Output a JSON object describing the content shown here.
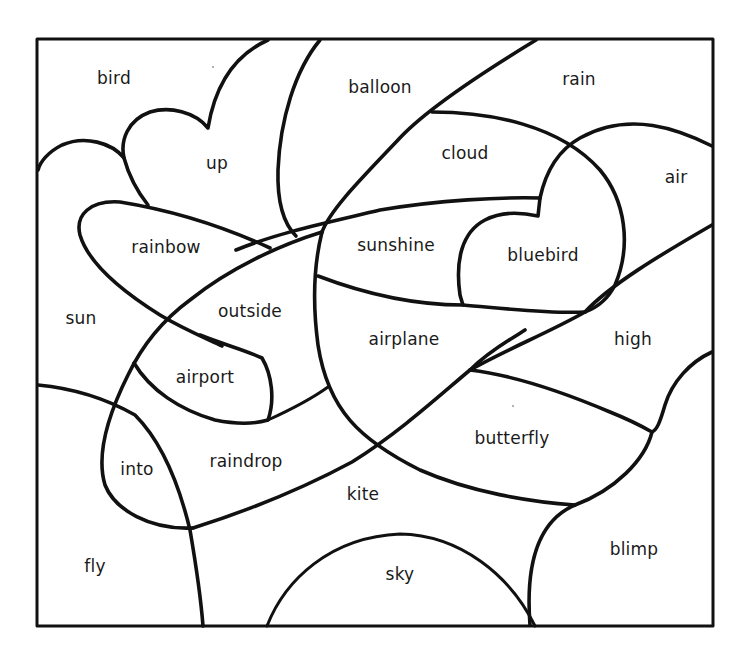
{
  "page": {
    "type": "color-by-word coloring worksheet",
    "background_color": "#ffffff",
    "line_color": "#111111",
    "text_color": "#1a1a1a"
  },
  "regions": [
    {
      "id": "bird",
      "label": "bird",
      "x": 114,
      "y": 78
    },
    {
      "id": "balloon",
      "label": "balloon",
      "x": 380,
      "y": 87
    },
    {
      "id": "rain",
      "label": "rain",
      "x": 579,
      "y": 79
    },
    {
      "id": "up",
      "label": "up",
      "x": 217,
      "y": 163
    },
    {
      "id": "cloud",
      "label": "cloud",
      "x": 465,
      "y": 153
    },
    {
      "id": "air",
      "label": "air",
      "x": 676,
      "y": 177
    },
    {
      "id": "rainbow",
      "label": "rainbow",
      "x": 166,
      "y": 247
    },
    {
      "id": "sunshine",
      "label": "sunshine",
      "x": 396,
      "y": 245
    },
    {
      "id": "bluebird",
      "label": "bluebird",
      "x": 543,
      "y": 255
    },
    {
      "id": "sun",
      "label": "sun",
      "x": 81,
      "y": 318
    },
    {
      "id": "outside",
      "label": "outside",
      "x": 250,
      "y": 311
    },
    {
      "id": "airplane",
      "label": "airplane",
      "x": 404,
      "y": 339
    },
    {
      "id": "high",
      "label": "high",
      "x": 633,
      "y": 339
    },
    {
      "id": "airport",
      "label": "airport",
      "x": 205,
      "y": 377
    },
    {
      "id": "butterfly",
      "label": "butterfly",
      "x": 512,
      "y": 438
    },
    {
      "id": "raindrop",
      "label": "raindrop",
      "x": 246,
      "y": 461
    },
    {
      "id": "into",
      "label": "into",
      "x": 137,
      "y": 469
    },
    {
      "id": "kite",
      "label": "kite",
      "x": 363,
      "y": 494
    },
    {
      "id": "blimp",
      "label": "blimp",
      "x": 634,
      "y": 549
    },
    {
      "id": "fly",
      "label": "fly",
      "x": 95,
      "y": 566
    },
    {
      "id": "sky",
      "label": "sky",
      "x": 400,
      "y": 574
    }
  ]
}
